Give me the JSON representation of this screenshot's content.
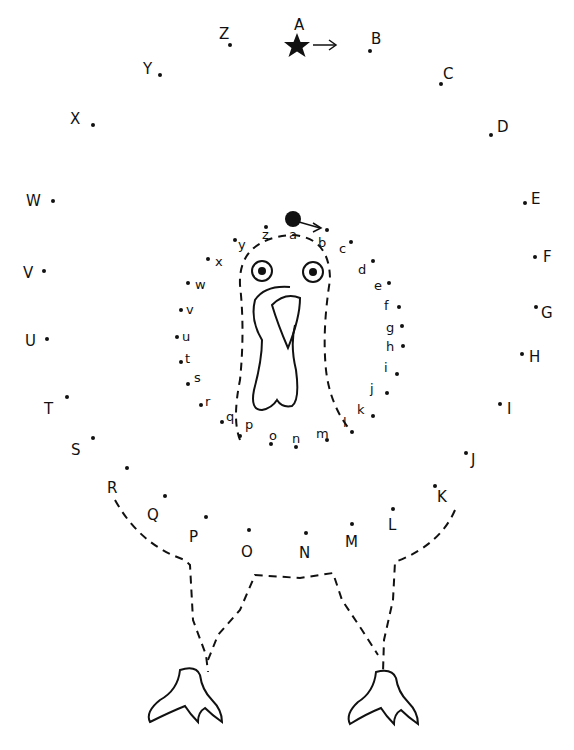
{
  "worksheet": {
    "subject": "turkey dot-to-dot",
    "start_marker": "star",
    "inner_start_marker": "filled-circle"
  },
  "outer_points": [
    {
      "label": "A",
      "dx": 297,
      "dy": 47,
      "lx": 294,
      "ly": 18
    },
    {
      "label": "B",
      "dx": 370,
      "dy": 51,
      "lx": 371,
      "ly": 32
    },
    {
      "label": "C",
      "dx": 441,
      "dy": 84,
      "lx": 443,
      "ly": 67
    },
    {
      "label": "D",
      "dx": 491,
      "dy": 135,
      "lx": 497,
      "ly": 120
    },
    {
      "label": "E",
      "dx": 525,
      "dy": 203,
      "lx": 531,
      "ly": 192
    },
    {
      "label": "F",
      "dx": 535,
      "dy": 257,
      "lx": 543,
      "ly": 250
    },
    {
      "label": "G",
      "dx": 536,
      "dy": 307,
      "lx": 541,
      "ly": 306
    },
    {
      "label": "H",
      "dx": 522,
      "dy": 354,
      "lx": 529,
      "ly": 350
    },
    {
      "label": "I",
      "dx": 500,
      "dy": 404,
      "lx": 507,
      "ly": 402
    },
    {
      "label": "J",
      "dx": 466,
      "dy": 453,
      "lx": 471,
      "ly": 453
    },
    {
      "label": "K",
      "dx": 435,
      "dy": 486,
      "lx": 437,
      "ly": 490
    },
    {
      "label": "L",
      "dx": 393,
      "dy": 509,
      "lx": 388,
      "ly": 518
    },
    {
      "label": "M",
      "dx": 352,
      "dy": 524,
      "lx": 345,
      "ly": 535
    },
    {
      "label": "N",
      "dx": 306,
      "dy": 533,
      "lx": 299,
      "ly": 546
    },
    {
      "label": "O",
      "dx": 249,
      "dy": 530,
      "lx": 241,
      "ly": 545
    },
    {
      "label": "P",
      "dx": 206,
      "dy": 517,
      "lx": 189,
      "ly": 530
    },
    {
      "label": "Q",
      "dx": 165,
      "dy": 496,
      "lx": 147,
      "ly": 508
    },
    {
      "label": "R",
      "dx": 127,
      "dy": 468,
      "lx": 107,
      "ly": 481
    },
    {
      "label": "S",
      "dx": 93,
      "dy": 438,
      "lx": 71,
      "ly": 443
    },
    {
      "label": "T",
      "dx": 67,
      "dy": 397,
      "lx": 44,
      "ly": 402
    },
    {
      "label": "U",
      "dx": 47,
      "dy": 339,
      "lx": 25,
      "ly": 334
    },
    {
      "label": "V",
      "dx": 44,
      "dy": 271,
      "lx": 23,
      "ly": 266
    },
    {
      "label": "W",
      "dx": 53,
      "dy": 201,
      "lx": 26,
      "ly": 194
    },
    {
      "label": "X",
      "dx": 93,
      "dy": 125,
      "lx": 70,
      "ly": 112
    },
    {
      "label": "Y",
      "dx": 160,
      "dy": 75,
      "lx": 143,
      "ly": 62
    },
    {
      "label": "Z",
      "dx": 230,
      "dy": 45,
      "lx": 219,
      "ly": 27
    }
  ],
  "inner_points": [
    {
      "label": "a",
      "dx": 294,
      "dy": 219,
      "lx": 289,
      "ly": 228
    },
    {
      "label": "b",
      "dx": 327,
      "dy": 230,
      "lx": 318,
      "ly": 236
    },
    {
      "label": "c",
      "dx": 351,
      "dy": 242,
      "lx": 339,
      "ly": 242
    },
    {
      "label": "d",
      "dx": 373,
      "dy": 261,
      "lx": 358,
      "ly": 263
    },
    {
      "label": "e",
      "dx": 389,
      "dy": 283,
      "lx": 374,
      "ly": 279
    },
    {
      "label": "f",
      "dx": 399,
      "dy": 307,
      "lx": 384,
      "ly": 299
    },
    {
      "label": "g",
      "dx": 402,
      "dy": 326,
      "lx": 386,
      "ly": 321
    },
    {
      "label": "h",
      "dx": 403,
      "dy": 346,
      "lx": 386,
      "ly": 340
    },
    {
      "label": "i",
      "dx": 397,
      "dy": 374,
      "lx": 384,
      "ly": 361
    },
    {
      "label": "j",
      "dx": 387,
      "dy": 393,
      "lx": 370,
      "ly": 382
    },
    {
      "label": "k",
      "dx": 373,
      "dy": 416,
      "lx": 357,
      "ly": 403
    },
    {
      "label": "l",
      "dx": 352,
      "dy": 432,
      "lx": 343,
      "ly": 416
    },
    {
      "label": "m",
      "dx": 327,
      "dy": 440,
      "lx": 316,
      "ly": 427
    },
    {
      "label": "n",
      "dx": 296,
      "dy": 447,
      "lx": 292,
      "ly": 432
    },
    {
      "label": "o",
      "dx": 271,
      "dy": 444,
      "lx": 269,
      "ly": 429
    },
    {
      "label": "p",
      "dx": 240,
      "dy": 436,
      "lx": 245,
      "ly": 418
    },
    {
      "label": "q",
      "dx": 222,
      "dy": 422,
      "lx": 226,
      "ly": 410
    },
    {
      "label": "r",
      "dx": 201,
      "dy": 405,
      "lx": 205,
      "ly": 395
    },
    {
      "label": "s",
      "dx": 188,
      "dy": 384,
      "lx": 194,
      "ly": 371
    },
    {
      "label": "t",
      "dx": 181,
      "dy": 362,
      "lx": 185,
      "ly": 352
    },
    {
      "label": "u",
      "dx": 177,
      "dy": 337,
      "lx": 182,
      "ly": 330
    },
    {
      "label": "v",
      "dx": 181,
      "dy": 310,
      "lx": 186,
      "ly": 303
    },
    {
      "label": "w",
      "dx": 188,
      "dy": 283,
      "lx": 195,
      "ly": 278
    },
    {
      "label": "x",
      "dx": 208,
      "dy": 259,
      "lx": 215,
      "ly": 255
    },
    {
      "label": "y",
      "dx": 235,
      "dy": 240,
      "lx": 238,
      "ly": 238
    },
    {
      "label": "z",
      "dx": 266,
      "dy": 227,
      "lx": 262,
      "ly": 228
    }
  ]
}
